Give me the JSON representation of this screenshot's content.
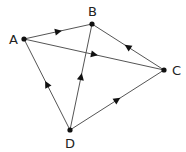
{
  "diagram": {
    "type": "directed-graph",
    "nodes": [
      {
        "id": "A",
        "label": "A",
        "x": 24,
        "y": 39,
        "lx": 9,
        "ly": 44
      },
      {
        "id": "B",
        "label": "B",
        "x": 92,
        "y": 24,
        "lx": 88,
        "ly": 16
      },
      {
        "id": "C",
        "label": "C",
        "x": 164,
        "y": 70,
        "lx": 172,
        "ly": 75
      },
      {
        "id": "D",
        "label": "D",
        "x": 70,
        "y": 130,
        "lx": 65,
        "ly": 148
      }
    ],
    "edges": [
      {
        "from": "A",
        "to": "B"
      },
      {
        "from": "A",
        "to": "C"
      },
      {
        "from": "C",
        "to": "B"
      },
      {
        "from": "D",
        "to": "A"
      },
      {
        "from": "D",
        "to": "B"
      },
      {
        "from": "D",
        "to": "C"
      }
    ],
    "colors": {
      "line": "#555555",
      "node": "#111111",
      "arrow": "#111111"
    }
  }
}
